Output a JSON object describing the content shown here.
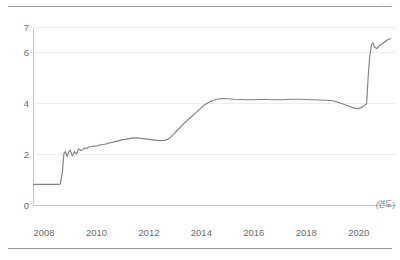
{
  "figure": {
    "top_rule": "",
    "bottom_rule": "",
    "corner_mark": "▭ ▭"
  },
  "axes": {
    "y_ticks": [
      "0",
      "2",
      "4",
      "6",
      "7"
    ],
    "x_ticks": [
      "2008",
      "2010",
      "2012",
      "2014",
      "2016",
      "2018",
      "2020"
    ],
    "x_unit_label": "(연도)"
  },
  "style": {
    "line_color": "#808085",
    "grid_color": "#ededee",
    "axis_color": "#c9c9cc",
    "rule_color": "#9a9aa0",
    "tick_text_color": "#6b6b6b"
  },
  "chart_data": {
    "type": "line",
    "title": "",
    "subtitle": "",
    "xlabel": "(연도)",
    "ylabel": "",
    "xlim": [
      2007.6,
      2021.4
    ],
    "ylim": [
      0,
      7
    ],
    "grid": true,
    "legend": null,
    "y_tick_values": [
      0,
      2,
      4,
      6,
      7
    ],
    "x_tick_values": [
      2008,
      2010,
      2012,
      2014,
      2016,
      2018,
      2020
    ],
    "series": [
      {
        "name": "series-1",
        "color": "#808085",
        "x": [
          2007.6,
          2007.9,
          2008.1,
          2008.3,
          2008.5,
          2008.62,
          2008.7,
          2008.76,
          2008.82,
          2008.88,
          2008.94,
          2009.0,
          2009.08,
          2009.16,
          2009.24,
          2009.32,
          2009.4,
          2009.48,
          2009.56,
          2009.64,
          2009.72,
          2009.8,
          2009.9,
          2010.0,
          2010.12,
          2010.24,
          2010.36,
          2010.48,
          2010.6,
          2010.72,
          2010.84,
          2010.96,
          2011.1,
          2011.25,
          2011.4,
          2011.55,
          2011.7,
          2011.85,
          2012.0,
          2012.15,
          2012.3,
          2012.45,
          2012.6,
          2012.75,
          2012.9,
          2013.05,
          2013.2,
          2013.35,
          2013.5,
          2013.65,
          2013.8,
          2013.95,
          2014.1,
          2014.25,
          2014.4,
          2014.55,
          2014.7,
          2014.85,
          2015.0,
          2015.25,
          2015.5,
          2015.75,
          2016.0,
          2016.25,
          2016.5,
          2016.75,
          2017.0,
          2017.25,
          2017.5,
          2017.75,
          2018.0,
          2018.25,
          2018.5,
          2018.75,
          2019.0,
          2019.2,
          2019.4,
          2019.6,
          2019.8,
          2019.95,
          2020.05,
          2020.12,
          2020.18,
          2020.24,
          2020.3,
          2020.36,
          2020.42,
          2020.48,
          2020.54,
          2020.6,
          2020.7,
          2020.8,
          2020.9,
          2021.0,
          2021.1,
          2021.2
        ],
        "y": [
          0.83,
          0.83,
          0.83,
          0.83,
          0.83,
          0.84,
          1.3,
          2.05,
          2.12,
          1.92,
          2.1,
          2.18,
          1.95,
          2.12,
          2.02,
          2.22,
          2.16,
          2.2,
          2.26,
          2.24,
          2.3,
          2.32,
          2.34,
          2.33,
          2.38,
          2.4,
          2.42,
          2.46,
          2.48,
          2.52,
          2.54,
          2.58,
          2.6,
          2.63,
          2.66,
          2.66,
          2.64,
          2.62,
          2.6,
          2.58,
          2.56,
          2.55,
          2.56,
          2.62,
          2.76,
          2.92,
          3.08,
          3.24,
          3.38,
          3.52,
          3.66,
          3.8,
          3.94,
          4.04,
          4.12,
          4.17,
          4.2,
          4.21,
          4.2,
          4.18,
          4.17,
          4.16,
          4.16,
          4.17,
          4.17,
          4.16,
          4.16,
          4.17,
          4.18,
          4.18,
          4.17,
          4.16,
          4.15,
          4.14,
          4.12,
          4.06,
          3.99,
          3.92,
          3.84,
          3.8,
          3.84,
          3.86,
          3.92,
          3.95,
          4.0,
          5.1,
          5.9,
          6.3,
          6.4,
          6.22,
          6.18,
          6.3,
          6.36,
          6.44,
          6.52,
          6.56
        ]
      }
    ]
  }
}
